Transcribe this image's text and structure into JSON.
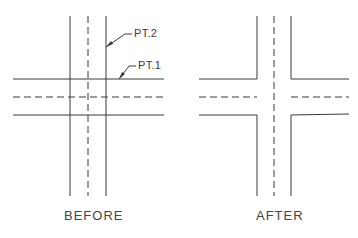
{
  "diagram": {
    "before": {
      "caption": "BEFORE",
      "callouts": [
        {
          "label": "PT.2"
        },
        {
          "label": "PT.1"
        }
      ]
    },
    "after": {
      "caption": "AFTER"
    },
    "colors": {
      "line": "#3a3a3a",
      "background": "#ffffff"
    }
  }
}
